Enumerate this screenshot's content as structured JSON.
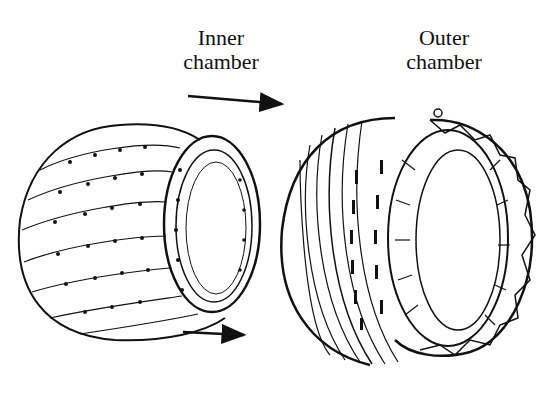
{
  "diagram": {
    "labels": {
      "inner": {
        "line1": "Inner",
        "line2": "chamber"
      },
      "outer": {
        "line1": "Outer",
        "line2": "chamber"
      }
    },
    "arrows": [
      {
        "name": "top-arrow",
        "direction": "right"
      },
      {
        "name": "bottom-arrow",
        "direction": "right"
      }
    ],
    "colors": {
      "ink": "#111111",
      "background": "#ffffff"
    }
  }
}
